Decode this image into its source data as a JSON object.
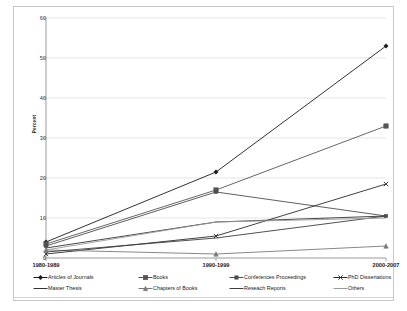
{
  "chart_data": {
    "type": "line",
    "title": "",
    "xlabel": "",
    "ylabel": "Percent",
    "categories": [
      "1980-1989",
      "1990-1999",
      "2000-2007"
    ],
    "ylim": [
      0,
      60
    ],
    "yticks": [
      0,
      10,
      20,
      30,
      40,
      50,
      60
    ],
    "grid": true,
    "legend_position": "below",
    "series": [
      {
        "name": "Articles of Journals",
        "marker": "diamond",
        "color": "#1a1a1a",
        "values": [
          4.0,
          21.5,
          53.0
        ]
      },
      {
        "name": "Books",
        "marker": "square",
        "color": "#555555",
        "values": [
          3.5,
          17.0,
          33.0
        ]
      },
      {
        "name": "Conferences Proceedings",
        "marker": "square-small",
        "color": "#4d4d4d",
        "values": [
          3.0,
          16.5,
          10.5
        ]
      },
      {
        "name": "PhD Dissertations",
        "marker": "cross",
        "color": "#2b2b2b",
        "values": [
          1.0,
          5.5,
          18.5
        ]
      },
      {
        "name": "Master Thesis",
        "marker": "none",
        "color": "#333333",
        "values": [
          2.5,
          9.0,
          10.5
        ]
      },
      {
        "name": "Chapters of Books",
        "marker": "triangle",
        "color": "#7a7a7a",
        "values": [
          2.0,
          1.0,
          3.0
        ]
      },
      {
        "name": "Reseach Reports",
        "marker": "none",
        "color": "#3d3d3d",
        "values": [
          1.5,
          5.0,
          10.5
        ]
      },
      {
        "name": "Others",
        "marker": "none",
        "color": "#9a9a9a",
        "values": [
          2.0,
          9.0,
          10.0
        ]
      }
    ]
  },
  "axis": {
    "y_label": "Percent",
    "y_ticks": [
      "0",
      "10",
      "20",
      "30",
      "40",
      "50",
      "60"
    ],
    "x_ticks": [
      "1980-1989",
      "1990-1999",
      "2000-2007"
    ]
  },
  "legend": {
    "items": [
      {
        "label": "Articles of Journals"
      },
      {
        "label": "Books"
      },
      {
        "label": "Conferences Proceedings"
      },
      {
        "label": "PhD Dissertations"
      },
      {
        "label": "Master Thesis"
      },
      {
        "label": "Chapters of Books"
      },
      {
        "label": "Reseach Reports"
      },
      {
        "label": "Others"
      }
    ]
  },
  "colors": {
    "grid": "#d9d9d9",
    "axis": "#808080",
    "frame": "#c8c8c8",
    "text": "#1a1a1a",
    "background": "#ffffff"
  }
}
